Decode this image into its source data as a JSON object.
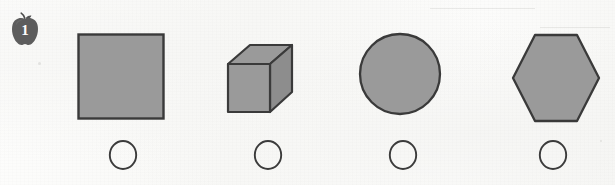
{
  "worksheet": {
    "type": "printed-worksheet-row",
    "question_number": "1",
    "marker_icon": "apple-icon",
    "background_color": "#fbfbfa"
  },
  "palette": {
    "shape_fill": "#9a9a9a",
    "shape_outline": "#3a3a3a",
    "cube_top_fill": "#9a9a9a",
    "cube_side_fill": "#8d8d8d",
    "bubble_outline": "#3b3b3b",
    "apple_body": "#5d5d5d",
    "apple_stem": "#4a4a4a",
    "number_color": "#fdfdfc"
  },
  "shapes": [
    {
      "name": "square",
      "icon": "square-icon",
      "label": "Square",
      "fill": "#9a9a9a",
      "outline": "#3a3a3a"
    },
    {
      "name": "cube",
      "icon": "cube-icon",
      "label": "Cube",
      "fill": "#9a9a9a",
      "outline": "#3a3a3a"
    },
    {
      "name": "circle",
      "icon": "circle-icon",
      "label": "Circle",
      "fill": "#9a9a9a",
      "outline": "#3a3a3a"
    },
    {
      "name": "hexagon",
      "icon": "hexagon-icon",
      "label": "Hexagon",
      "fill": "#9a9a9a",
      "outline": "#3a3a3a"
    }
  ],
  "answer_options": [
    {
      "index": "1",
      "for_shape": "square",
      "selected": false
    },
    {
      "index": "2",
      "for_shape": "cube",
      "selected": false
    },
    {
      "index": "3",
      "for_shape": "circle",
      "selected": false
    },
    {
      "index": "4",
      "for_shape": "hexagon",
      "selected": false
    }
  ]
}
